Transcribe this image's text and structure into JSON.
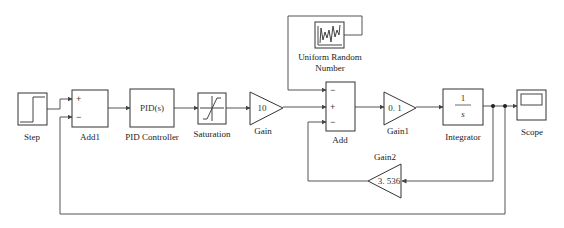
{
  "diagram": {
    "type": "simulink-block-diagram",
    "blocks": [
      {
        "id": "step",
        "label": "Step",
        "icon": "step-signal-icon"
      },
      {
        "id": "add1",
        "label": "Add1",
        "signs": [
          "+",
          "−"
        ]
      },
      {
        "id": "pid",
        "label": "PID Controller",
        "content": "PID(s)"
      },
      {
        "id": "saturation",
        "label": "Saturation",
        "icon": "saturation-icon"
      },
      {
        "id": "gain",
        "label": "Gain",
        "value": "10"
      },
      {
        "id": "random",
        "label_line1": "Uniform Random",
        "label_line2": "Number",
        "icon": "random-signal-icon"
      },
      {
        "id": "add",
        "label": "Add",
        "signs": [
          "−",
          "+",
          "−"
        ]
      },
      {
        "id": "gain1",
        "label": "Gain1",
        "value": "0. 1"
      },
      {
        "id": "integrator",
        "label": "Integrator",
        "numerator": "1",
        "denominator": "s"
      },
      {
        "id": "scope",
        "label": "Scope",
        "icon": "scope-icon"
      },
      {
        "id": "gain2",
        "label": "Gain2",
        "value": "3. 536"
      }
    ],
    "connections": [
      "Step -> Add1(+)",
      "Add1 -> PID Controller",
      "PID Controller -> Saturation",
      "Saturation -> Gain",
      "Gain -> Add(+)",
      "Uniform Random Number -> Add(−, top)",
      "Add -> Gain1",
      "Gain1 -> Integrator",
      "Integrator -> Scope",
      "Integrator -> Gain2 -> Add(−, bottom)",
      "Integrator -> Add1(−)"
    ]
  }
}
